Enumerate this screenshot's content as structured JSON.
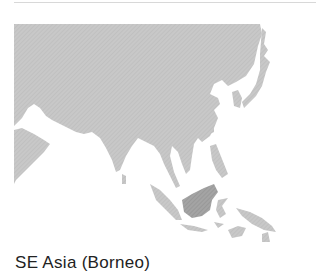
{
  "map": {
    "region": "Asia",
    "highlighted_region": "Borneo",
    "land_color": "#c4c4c4",
    "highlight_color": "#9a9a9a",
    "water_color": "#ffffff"
  },
  "caption": {
    "text": "SE Asia (Borneo)"
  }
}
